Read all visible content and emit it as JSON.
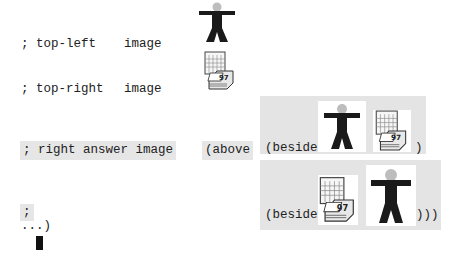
{
  "editor": {
    "lines": {
      "top_left_comment": "; top-left",
      "top_left_type": "image",
      "top_right_comment": "; top-right",
      "top_right_type": "image",
      "right_answer_comment": "; right answer image",
      "above_open": "(above",
      "beside_open_1": "(beside",
      "beside_close_1": ")",
      "beside_open_2": "(beside",
      "beside_close_2": ")))",
      "semicolon": ";",
      "ellipsis": "...)"
    },
    "images": {
      "person": "person-icon",
      "calendar": "calendar-97-icon",
      "calendar_label": "97"
    },
    "colors": {
      "highlight": "#e4e4e4",
      "text": "#222222",
      "figure": "#1a1a1a"
    }
  }
}
